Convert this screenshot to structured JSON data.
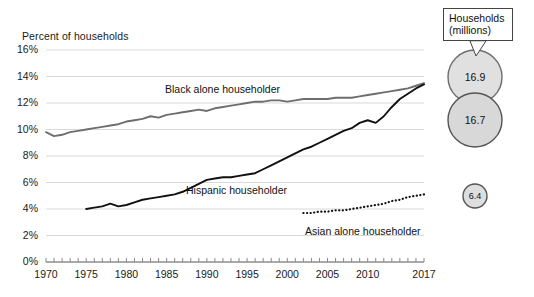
{
  "chart_data": {
    "type": "line",
    "title": "",
    "ylabel": "Percent of households",
    "xlabel": "",
    "ylim": [
      0,
      16
    ],
    "xlim": [
      1970,
      2017
    ],
    "grid": true,
    "ytick_labels": [
      "16%",
      "14%",
      "12%",
      "10%",
      "8%",
      "6%",
      "4%",
      "2%",
      "0%"
    ],
    "ytick_values": [
      16,
      14,
      12,
      10,
      8,
      6,
      4,
      2,
      0
    ],
    "xtick_labels": [
      "1970",
      "1975",
      "1980",
      "1985",
      "1990",
      "1995",
      "2000",
      "2005",
      "2010",
      "2017"
    ],
    "xtick_values": [
      1970,
      1975,
      1980,
      1985,
      1990,
      1995,
      2000,
      2005,
      2010,
      2017
    ],
    "legend_position": "inline-annotations",
    "series": [
      {
        "name": "Black alone householder",
        "style": "solid",
        "color": "#6e6e6e",
        "x": [
          1970,
          1971,
          1972,
          1973,
          1974,
          1975,
          1976,
          1977,
          1978,
          1979,
          1980,
          1981,
          1982,
          1983,
          1984,
          1985,
          1986,
          1987,
          1988,
          1989,
          1990,
          1991,
          1992,
          1993,
          1994,
          1995,
          1996,
          1997,
          1998,
          1999,
          2000,
          2001,
          2002,
          2003,
          2004,
          2005,
          2006,
          2007,
          2008,
          2009,
          2010,
          2011,
          2012,
          2013,
          2014,
          2015,
          2016,
          2017
        ],
        "values": [
          9.8,
          9.5,
          9.6,
          9.8,
          9.9,
          10.0,
          10.1,
          10.2,
          10.3,
          10.4,
          10.6,
          10.7,
          10.8,
          11.0,
          10.9,
          11.1,
          11.2,
          11.3,
          11.4,
          11.5,
          11.4,
          11.6,
          11.7,
          11.8,
          11.9,
          12.0,
          12.1,
          12.1,
          12.2,
          12.2,
          12.1,
          12.2,
          12.3,
          12.3,
          12.3,
          12.3,
          12.4,
          12.4,
          12.4,
          12.5,
          12.6,
          12.7,
          12.8,
          12.9,
          13.0,
          13.1,
          13.3,
          13.5
        ]
      },
      {
        "name": "Hispanic householder",
        "style": "solid",
        "color": "#111111",
        "x": [
          1975,
          1976,
          1977,
          1978,
          1979,
          1980,
          1981,
          1982,
          1983,
          1984,
          1985,
          1986,
          1987,
          1988,
          1989,
          1990,
          1991,
          1992,
          1993,
          1994,
          1995,
          1996,
          1997,
          1998,
          1999,
          2000,
          2001,
          2002,
          2003,
          2004,
          2005,
          2006,
          2007,
          2008,
          2009,
          2010,
          2011,
          2012,
          2013,
          2014,
          2015,
          2016,
          2017
        ],
        "values": [
          4.0,
          4.1,
          4.2,
          4.4,
          4.2,
          4.3,
          4.5,
          4.7,
          4.8,
          4.9,
          5.0,
          5.1,
          5.3,
          5.6,
          5.9,
          6.2,
          6.3,
          6.4,
          6.4,
          6.5,
          6.6,
          6.7,
          7.0,
          7.3,
          7.6,
          7.9,
          8.2,
          8.5,
          8.7,
          9.0,
          9.3,
          9.6,
          9.9,
          10.1,
          10.5,
          10.7,
          10.5,
          11.0,
          11.7,
          12.3,
          12.7,
          13.1,
          13.4
        ]
      },
      {
        "name": "Asian alone householder",
        "style": "dotted",
        "color": "#111111",
        "x": [
          2002,
          2003,
          2004,
          2005,
          2006,
          2007,
          2008,
          2009,
          2010,
          2011,
          2012,
          2013,
          2014,
          2015,
          2016,
          2017
        ],
        "values": [
          3.7,
          3.7,
          3.8,
          3.8,
          3.9,
          3.9,
          4.0,
          4.1,
          4.2,
          4.3,
          4.4,
          4.6,
          4.7,
          4.9,
          5.0,
          5.1
        ]
      }
    ],
    "bubbles": [
      {
        "label": "16.9",
        "series": "Black alone householder",
        "value": 16.9,
        "cx": 475,
        "cy": 77,
        "r": 27,
        "fill": "#e0e0e0",
        "stroke": "#6e6e6e"
      },
      {
        "label": "16.7",
        "series": "Hispanic householder",
        "value": 16.7,
        "cx": 475,
        "cy": 120,
        "r": 27,
        "fill": "#d8d8d8",
        "stroke": "#555555"
      },
      {
        "label": "6.4",
        "series": "Asian alone householder",
        "value": 6.4,
        "cx": 475,
        "cy": 196,
        "r": 12,
        "fill": "#dedede",
        "stroke": "#555555"
      }
    ],
    "callout": {
      "line1": "Households",
      "line2": "(millions)"
    },
    "annotations": [
      {
        "text": "Black alone householder",
        "x": 165,
        "y": 83
      },
      {
        "text": "Hispanic householder",
        "x": 186,
        "y": 184
      },
      {
        "text": "Asian alone householder",
        "x": 305,
        "y": 225
      }
    ]
  }
}
